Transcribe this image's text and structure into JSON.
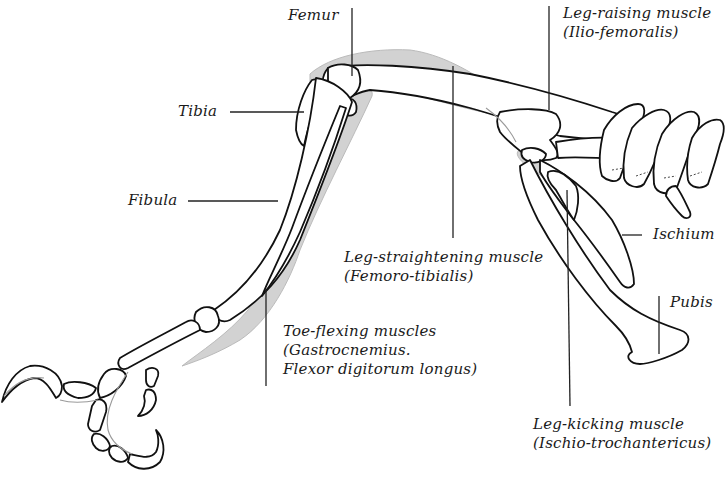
{
  "diagram": {
    "colors": {
      "bone_outline": "#111111",
      "bone_fill": "#ffffff",
      "muscle_fill": "#cfcfcf",
      "leader_line": "#222222",
      "text": "#1a1a1a",
      "background": "#ffffff"
    },
    "labels": {
      "femur": {
        "lines": [
          "Femur"
        ]
      },
      "tibia": {
        "lines": [
          "Tibia"
        ]
      },
      "fibula": {
        "lines": [
          "Fibula"
        ]
      },
      "ischium": {
        "lines": [
          "Ischium"
        ]
      },
      "pubis": {
        "lines": [
          "Pubis"
        ]
      },
      "leg_raising": {
        "lines": [
          "Leg-raising muscle",
          "(Ilio-femoralis)"
        ]
      },
      "leg_straightening": {
        "lines": [
          "Leg-straightening muscle",
          "(Femoro-tibialis)"
        ]
      },
      "toe_flexing": {
        "lines": [
          "Toe-flexing muscles",
          "(Gastrocnemius.",
          "Flexor digitorum longus)"
        ]
      },
      "leg_kicking": {
        "lines": [
          "Leg-kicking muscle",
          "(Ischio-trochantericus)"
        ]
      }
    }
  }
}
